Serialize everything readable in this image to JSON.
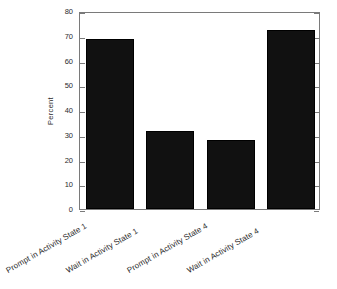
{
  "chart_data": {
    "type": "bar",
    "title": "",
    "xlabel": "",
    "ylabel": "Percent",
    "ylim": [
      0,
      80
    ],
    "yticks": [
      0,
      10,
      20,
      30,
      40,
      50,
      60,
      70,
      80
    ],
    "ytick_labels": [
      "0",
      "10",
      "20",
      "30",
      "40",
      "50",
      "60",
      "70",
      "80"
    ],
    "grid": false,
    "legend": null,
    "bar_color": "#111111",
    "categories": [
      "Prompt in Activity State 1",
      "Wait in Activity State 1",
      "Prompt in Activity State 4",
      "Wait in Activity State 4"
    ],
    "values": [
      68.5,
      31.5,
      27.8,
      72.5
    ]
  },
  "figure": {
    "background_color": "#ffffff",
    "axis_color": "#7a7a7a",
    "text_color": "#2b2b2b"
  }
}
